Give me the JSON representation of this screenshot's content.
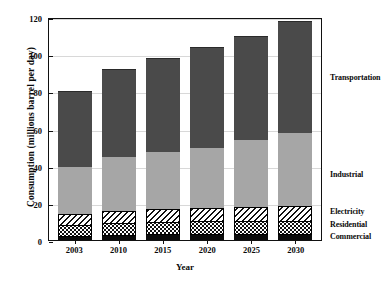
{
  "chart_data": {
    "type": "bar",
    "subtype": "stacked-bar",
    "title": "",
    "xlabel": "Year",
    "ylabel": "Consumption (millions barrel per day)",
    "categories": [
      "2003",
      "2010",
      "2015",
      "2020",
      "2025",
      "2030"
    ],
    "ylim": [
      0,
      120
    ],
    "yticks": [
      0,
      20,
      40,
      60,
      80,
      100,
      120
    ],
    "ytick_labels": [
      "0",
      "20",
      "40",
      "60",
      "80",
      "100",
      "120"
    ],
    "grid": true,
    "grid_axis": "y",
    "legend_position": "right",
    "stack_order_bottom_to_top": [
      "Commercial",
      "Residential",
      "Electricity",
      "Industrial",
      "Transportation"
    ],
    "series": [
      {
        "name": "Commercial",
        "fill": "solid-black",
        "color": "#0d0d0d",
        "values": [
          2,
          2.5,
          3,
          3,
          3.5,
          3.5
        ]
      },
      {
        "name": "Residential",
        "fill": "dotted-checker",
        "color": "#ffffff",
        "values": [
          6,
          6.5,
          6.5,
          7,
          7,
          7
        ]
      },
      {
        "name": "Electricity",
        "fill": "diagonal-hatch",
        "color": "#ffffff",
        "values": [
          6,
          6.5,
          7,
          7,
          7.5,
          8
        ]
      },
      {
        "name": "Industrial",
        "fill": "solid-light-gray",
        "color": "#a6a6a6",
        "values": [
          26,
          29.5,
          31.5,
          33,
          36.5,
          39.5
        ]
      },
      {
        "name": "Transportation",
        "fill": "solid-dark-gray",
        "color": "#4a4a4a",
        "values": [
          40,
          47,
          50,
          54,
          55.5,
          60
        ]
      }
    ],
    "totals": [
      80,
      92,
      98,
      104,
      110,
      118
    ]
  },
  "legend": {
    "entries": [
      {
        "label": "Transportation",
        "value_position": 88
      },
      {
        "label": "Industrial",
        "value_position": 36
      },
      {
        "label": "Electricity",
        "value_position": 16
      },
      {
        "label": "Residential",
        "value_position": 9
      },
      {
        "label": "Commercial",
        "value_position": 2.5
      }
    ]
  },
  "colors": {
    "transportation": "#4a4a4a",
    "industrial": "#a6a6a6",
    "electricity": "#ffffff",
    "residential": "#ffffff",
    "commercial": "#0d0d0d",
    "axis": "#111111",
    "grid": "#d8d8d8",
    "background": "#ffffff"
  }
}
